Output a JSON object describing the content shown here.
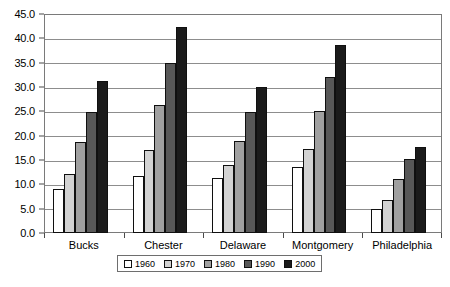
{
  "chart_data": {
    "type": "bar",
    "title": "",
    "subtitle": "",
    "xlabel": "",
    "ylabel": "",
    "categories": [
      "Bucks",
      "Chester",
      "Delaware",
      "Montgomery",
      "Philadelphia"
    ],
    "series": [
      {
        "name": "1960",
        "values": [
          9.0,
          11.7,
          11.4,
          13.6,
          5.0
        ],
        "color": "#ffffff"
      },
      {
        "name": "1970",
        "values": [
          12.2,
          17.1,
          14.0,
          17.2,
          6.7
        ],
        "color": "#d2d2d2"
      },
      {
        "name": "1980",
        "values": [
          18.7,
          26.3,
          19.0,
          25.0,
          11.0
        ],
        "color": "#a0a0a0"
      },
      {
        "name": "1990",
        "values": [
          24.9,
          34.9,
          24.9,
          32.0,
          15.2
        ],
        "color": "#585858"
      },
      {
        "name": "2000",
        "values": [
          31.2,
          42.3,
          30.0,
          38.7,
          17.7
        ],
        "color": "#1b1b1b"
      }
    ],
    "ylim": [
      0.0,
      45.0
    ],
    "ytick_step": 5.0,
    "yticks": [
      "0.0",
      "5.0",
      "10.0",
      "15.0",
      "20.0",
      "25.0",
      "30.0",
      "35.0",
      "40.0",
      "45.0"
    ],
    "grid": true,
    "grid_axis": "y",
    "legend_position": "bottom",
    "legend_entries": [
      "1960",
      "1970",
      "1980",
      "1990",
      "2000"
    ]
  }
}
